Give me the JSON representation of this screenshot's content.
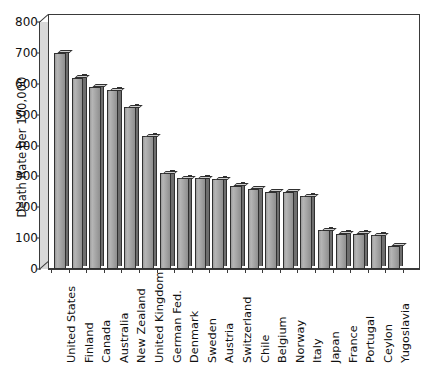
{
  "chart_data": {
    "type": "bar",
    "title": "",
    "subtitle": "",
    "xlabel": "",
    "ylabel": "Death Rate per 100,000",
    "ylim": [
      0,
      800
    ],
    "yticks": [
      0,
      100,
      200,
      300,
      400,
      500,
      600,
      700,
      800
    ],
    "grid": false,
    "legend": null,
    "orientation": "vertical",
    "style": "3d-shaded-gray-bars",
    "bar_color": "#a9a9a9",
    "bar_edge_color": "#303030",
    "bar_top_color": "#cfcfcf",
    "bar_side_color": "#6e6e6e",
    "axis_color": "#3a3a3a",
    "background": "#ffffff",
    "categories": [
      "United States",
      "Finland",
      "Canada",
      "Australia",
      "New Zealand",
      "United Kingdom",
      "German Fed.",
      "Denmark",
      "Sweden",
      "Austria",
      "Switzerland",
      "Chile",
      "Belgium",
      "Norway",
      "Italy",
      "Japan",
      "France",
      "Portugal",
      "Ceylon",
      "Yugoslavia"
    ],
    "values": [
      700,
      620,
      590,
      580,
      525,
      430,
      310,
      295,
      295,
      290,
      270,
      260,
      250,
      250,
      235,
      125,
      115,
      115,
      110,
      75
    ]
  }
}
